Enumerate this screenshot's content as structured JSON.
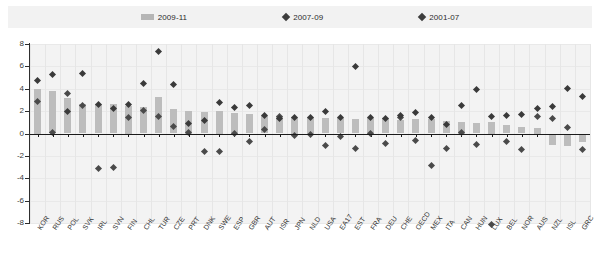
{
  "legend": {
    "items": [
      {
        "label": "2009-11",
        "marker": "bar-swatch-icon",
        "color": "#b6b6b6"
      },
      {
        "label": "2007-09",
        "marker": "diamond-icon",
        "color": "#4a4a4a"
      },
      {
        "label": "2001-07",
        "marker": "diamond-icon",
        "color": "#3a3a3a"
      }
    ]
  },
  "chart_data": {
    "type": "bar",
    "title": "",
    "subtitle": "",
    "xlabel": "",
    "ylabel": "",
    "ylim": [
      -8,
      8
    ],
    "yticks": [
      8,
      6,
      4,
      2,
      0,
      -2,
      -4,
      -6,
      -8
    ],
    "grid": true,
    "legend_position": "top",
    "categories": [
      "KOR",
      "RUS",
      "POL",
      "SVK",
      "IRL",
      "SVN",
      "FIN",
      "CHL",
      "TUR",
      "CZE",
      "PRT",
      "DNK",
      "SWE",
      "ESP",
      "GBR",
      "AUT",
      "ISR",
      "JPN",
      "NLD",
      "USA",
      "EA17",
      "EST",
      "FRA",
      "DEU",
      "CHE",
      "OECD",
      "MEX",
      "ITA",
      "CAN",
      "HUN",
      "LUX",
      "BEL",
      "NOR",
      "AUS",
      "NZL",
      "ISL",
      "GRC"
    ],
    "series": [
      {
        "name": "2009-11",
        "type": "bar",
        "color": "#bdbdbd",
        "values": [
          4.0,
          3.8,
          3.2,
          2.6,
          2.6,
          2.6,
          2.5,
          2.4,
          3.3,
          2.2,
          2.0,
          1.9,
          2.0,
          1.8,
          1.7,
          1.6,
          1.6,
          1.5,
          1.5,
          1.4,
          1.4,
          1.3,
          1.4,
          1.4,
          1.2,
          1.3,
          1.3,
          1.1,
          1.0,
          0.9,
          1.0,
          0.8,
          0.6,
          0.5,
          -1.0,
          -1.1,
          -0.8
        ]
      },
      {
        "name": "2007-09",
        "type": "scatter",
        "marker": "diamond",
        "color": "#4a4a4a",
        "values": [
          2.9,
          0.05,
          3.6,
          2.5,
          -3.1,
          -3.0,
          1.4,
          2.1,
          1.5,
          0.6,
          0.1,
          -1.6,
          -1.6,
          0.0,
          -0.7,
          0.4,
          1.5,
          -0.2,
          -0.1,
          -1.1,
          -0.3,
          -1.3,
          0.0,
          -0.9,
          1.4,
          -0.6,
          -2.9,
          -1.3,
          0.1,
          -1.0,
          -8.1,
          -0.7,
          -1.4,
          1.5,
          1.3,
          0.5,
          -1.4
        ]
      },
      {
        "name": "2001-07",
        "type": "scatter",
        "marker": "diamond",
        "color": "#3a3a3a",
        "values": [
          4.7,
          5.3,
          2.0,
          5.4,
          2.6,
          2.2,
          2.6,
          4.5,
          7.3,
          4.4,
          0.9,
          1.2,
          2.8,
          2.3,
          2.5,
          1.6,
          1.3,
          1.4,
          1.4,
          2.0,
          1.4,
          6.0,
          1.4,
          1.3,
          1.6,
          1.9,
          1.4,
          0.8,
          2.5,
          3.9,
          1.5,
          1.6,
          1.7,
          2.2,
          2.4,
          4.0,
          3.3
        ]
      }
    ]
  }
}
